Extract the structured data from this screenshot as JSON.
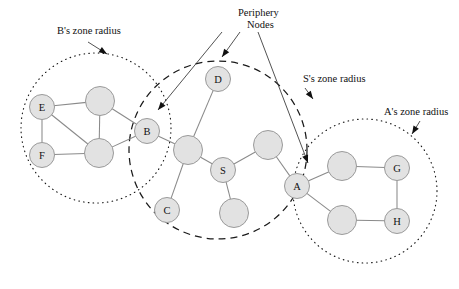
{
  "figure": {
    "background_color": "#ffffff",
    "node_fill": "#e2e2e2",
    "node_stroke": "#9a9a9a",
    "edge_color": "#8a8a8a",
    "annotation_color": "#111111"
  },
  "annotations": {
    "b_zone": {
      "label": "B's zone radius",
      "x": 57,
      "y": 34
    },
    "periphery": {
      "line1": "Periphery",
      "line2": "Nodes",
      "x": 238,
      "y": 16
    },
    "s_zone": {
      "label": "S's zone radius",
      "x": 303,
      "y": 82
    },
    "a_zone": {
      "label": "A's zone radius",
      "x": 384,
      "y": 115
    }
  },
  "zones": [
    {
      "name": "b-zone",
      "style": "dotted",
      "cx": 96,
      "cy": 128,
      "r": 75
    },
    {
      "name": "s-zone",
      "style": "dashed",
      "cx": 218,
      "cy": 150,
      "r": 89
    },
    {
      "name": "a-zone",
      "style": "dotted",
      "cx": 365,
      "cy": 191,
      "r": 72
    }
  ],
  "nodes": [
    {
      "id": "E",
      "label": "E",
      "cx": 42,
      "cy": 107,
      "r": 12.5
    },
    {
      "id": "F",
      "label": "F",
      "cx": 42,
      "cy": 155,
      "r": 12.5
    },
    {
      "id": "n1",
      "label": "",
      "cx": 100,
      "cy": 101,
      "r": 14.5
    },
    {
      "id": "n2",
      "label": "",
      "cx": 99,
      "cy": 153,
      "r": 14.5
    },
    {
      "id": "B",
      "label": "B",
      "cx": 147,
      "cy": 131,
      "r": 12.5
    },
    {
      "id": "n3",
      "label": "",
      "cx": 188,
      "cy": 150,
      "r": 14.5
    },
    {
      "id": "D",
      "label": "D",
      "cx": 218,
      "cy": 79,
      "r": 12.5
    },
    {
      "id": "S",
      "label": "S",
      "cx": 223,
      "cy": 170,
      "r": 12.5
    },
    {
      "id": "C",
      "label": "C",
      "cx": 167,
      "cy": 210,
      "r": 12.5
    },
    {
      "id": "n4",
      "label": "",
      "cx": 234,
      "cy": 213,
      "r": 14.5
    },
    {
      "id": "n5",
      "label": "",
      "cx": 268,
      "cy": 145,
      "r": 14.5
    },
    {
      "id": "A",
      "label": "A",
      "cx": 297,
      "cy": 186,
      "r": 12.5
    },
    {
      "id": "n6",
      "label": "",
      "cx": 342,
      "cy": 166,
      "r": 14.5
    },
    {
      "id": "n7",
      "label": "",
      "cx": 342,
      "cy": 220,
      "r": 14.5
    },
    {
      "id": "G",
      "label": "G",
      "cx": 397,
      "cy": 168,
      "r": 12.5
    },
    {
      "id": "H",
      "label": "H",
      "cx": 397,
      "cy": 221,
      "r": 12.5
    }
  ],
  "edges": [
    {
      "from": "E",
      "to": "n1"
    },
    {
      "from": "E",
      "to": "F"
    },
    {
      "from": "E",
      "to": "n2"
    },
    {
      "from": "F",
      "to": "n2"
    },
    {
      "from": "n1",
      "to": "n2"
    },
    {
      "from": "n1",
      "to": "B"
    },
    {
      "from": "n2",
      "to": "B"
    },
    {
      "from": "B",
      "to": "n3"
    },
    {
      "from": "n3",
      "to": "D"
    },
    {
      "from": "n3",
      "to": "S"
    },
    {
      "from": "n3",
      "to": "C"
    },
    {
      "from": "S",
      "to": "n4"
    },
    {
      "from": "S",
      "to": "n5"
    },
    {
      "from": "n5",
      "to": "A"
    },
    {
      "from": "A",
      "to": "n6"
    },
    {
      "from": "A",
      "to": "n7"
    },
    {
      "from": "n6",
      "to": "G"
    },
    {
      "from": "n7",
      "to": "H"
    },
    {
      "from": "G",
      "to": "H"
    }
  ],
  "leaders": [
    {
      "name": "b-zone-leader",
      "x1": 88,
      "y1": 42,
      "x2": 107,
      "y2": 54,
      "angle": 32
    },
    {
      "name": "periphery-leader-b",
      "x1": 222,
      "y1": 32,
      "x2": 158,
      "y2": 110,
      "angle": 129
    },
    {
      "name": "periphery-leader-d",
      "x1": 240,
      "y1": 32,
      "x2": 222,
      "y2": 57,
      "angle": 125
    },
    {
      "name": "periphery-leader-a",
      "x1": 258,
      "y1": 32,
      "x2": 308,
      "y2": 163,
      "angle": 69
    },
    {
      "name": "s-zone-leader",
      "x1": 305,
      "y1": 88,
      "x2": 313,
      "y2": 99,
      "angle": 54
    },
    {
      "name": "a-zone-leader",
      "x1": 420,
      "y1": 121,
      "x2": 412,
      "y2": 134,
      "angle": 122
    }
  ]
}
